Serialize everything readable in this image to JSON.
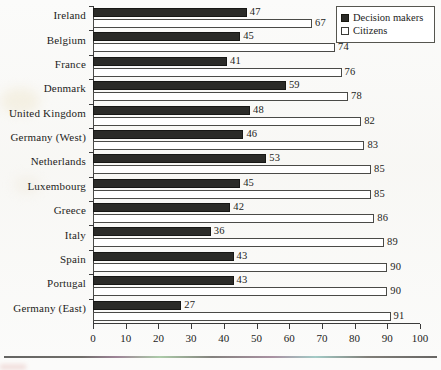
{
  "chart_data": {
    "type": "bar",
    "orientation": "horizontal",
    "title": "",
    "subtitle": "",
    "xlabel": "",
    "ylabel": "",
    "xlim": [
      0,
      100
    ],
    "xticks": [
      0,
      10,
      20,
      30,
      40,
      50,
      60,
      70,
      80,
      90,
      100
    ],
    "grid": false,
    "legend_position": "top-right",
    "categories": [
      "Ireland",
      "Belgium",
      "France",
      "Denmark",
      "United Kingdom",
      "Germany (West)",
      "Netherlands",
      "Luxembourg",
      "Greece",
      "Italy",
      "Spain",
      "Portugal",
      "Germany (East)"
    ],
    "series": [
      {
        "name": "Decision makers",
        "color": "#2b2b28",
        "values": [
          47,
          45,
          41,
          59,
          48,
          46,
          53,
          45,
          42,
          36,
          43,
          43,
          27
        ]
      },
      {
        "name": "Citizens",
        "color": "#ffffff",
        "values": [
          67,
          74,
          76,
          78,
          82,
          83,
          85,
          85,
          86,
          89,
          90,
          90,
          91
        ]
      }
    ]
  },
  "legend": {
    "items": [
      {
        "label": "Decision makers",
        "swatch": "filled-square"
      },
      {
        "label": "Citizens",
        "swatch": "empty-square"
      }
    ]
  }
}
